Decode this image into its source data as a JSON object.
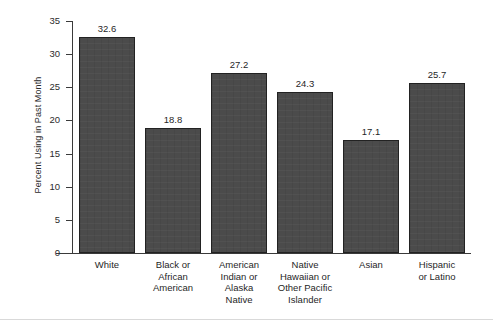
{
  "chart_data": {
    "type": "bar",
    "title": "",
    "xlabel": "",
    "ylabel": "Percent Using in Past Month",
    "ylim": [
      0,
      35
    ],
    "ytick_labels": [
      "0",
      "5",
      "10",
      "15",
      "20",
      "25",
      "30",
      "35"
    ],
    "yticks": [
      0,
      5,
      10,
      15,
      20,
      25,
      30,
      35
    ],
    "grid": false,
    "legend": "none",
    "categories": [
      "White",
      "Black or African American",
      "American Indian or Alaska Native",
      "Native Hawaiian or Other Pacific Islander",
      "Asian",
      "Hispanic or Latino"
    ],
    "category_lines": [
      [
        "White"
      ],
      [
        "Black or",
        "African",
        "American"
      ],
      [
        "American",
        "Indian or",
        "Alaska",
        "Native"
      ],
      [
        "Native",
        "Hawaiian or",
        "Other Pacific",
        "Islander"
      ],
      [
        "Asian"
      ],
      [
        "Hispanic",
        "or Latino"
      ]
    ],
    "values": [
      32.6,
      18.8,
      27.2,
      24.3,
      17.1,
      25.7
    ],
    "value_labels": [
      "32.6",
      "18.8",
      "27.2",
      "24.3",
      "17.1",
      "25.7"
    ],
    "colors": {
      "bar_fill": "#4b4b4b",
      "bar_edge": "#222222",
      "axis": "#3a3a3a",
      "text": "#1f1f1f",
      "background": "#ffffff"
    }
  }
}
